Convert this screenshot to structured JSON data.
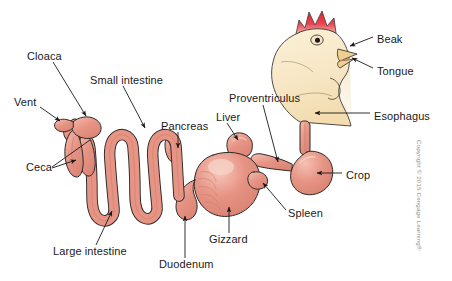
{
  "figure": {
    "background": "#ffffff",
    "copyright": "Copyright © 2015 Cengage Learning®"
  },
  "palette": {
    "organ_fill": "#e79485",
    "organ_fill_light": "#f2b4a6",
    "organ_highlight": "#f6c9bd",
    "organ_outline": "#2b2b2b",
    "head_fill": "#f7e6c4",
    "head_fill_light": "#fdf6e4",
    "comb_red": "#e3212b",
    "comb_red_light": "#f06a72",
    "beak_fill": "#f0cf8e",
    "label_color": "#1a1a1a",
    "leader_color": "#1a1a1a",
    "copyright_color": "#8c8c8c"
  },
  "labels": [
    {
      "id": "cloaca",
      "text": "Cloaca",
      "x": 27,
      "y": 57,
      "anchor": "start"
    },
    {
      "id": "vent",
      "text": "Vent",
      "x": 14,
      "y": 103,
      "anchor": "start"
    },
    {
      "id": "small-intestine",
      "text": "Small intestine",
      "x": 90,
      "y": 81,
      "anchor": "start"
    },
    {
      "id": "ceca",
      "text": "Ceca",
      "x": 26,
      "y": 168,
      "anchor": "start"
    },
    {
      "id": "large-intestine",
      "text": "Large intestine",
      "x": 53,
      "y": 252,
      "anchor": "start"
    },
    {
      "id": "pancreas",
      "text": "Pancreas",
      "x": 161,
      "y": 127,
      "anchor": "start"
    },
    {
      "id": "duodenum",
      "text": "Duodenum",
      "x": 159,
      "y": 265,
      "anchor": "start"
    },
    {
      "id": "liver",
      "text": "Liver",
      "x": 216,
      "y": 118,
      "anchor": "start"
    },
    {
      "id": "gizzard",
      "text": "Gizzard",
      "x": 209,
      "y": 240,
      "anchor": "start"
    },
    {
      "id": "proventriculus",
      "text": "Proventriculus",
      "x": 229,
      "y": 99,
      "anchor": "start"
    },
    {
      "id": "spleen",
      "text": "Spleen",
      "x": 288,
      "y": 214,
      "anchor": "start"
    },
    {
      "id": "crop",
      "text": "Crop",
      "x": 346,
      "y": 176,
      "anchor": "start"
    },
    {
      "id": "esophagus",
      "text": "Esophagus",
      "x": 374,
      "y": 117,
      "anchor": "start"
    },
    {
      "id": "beak",
      "text": "Beak",
      "x": 377,
      "y": 40,
      "anchor": "start"
    },
    {
      "id": "tongue",
      "text": "Tongue",
      "x": 377,
      "y": 72,
      "anchor": "start"
    }
  ],
  "organs": [
    {
      "id": "beak",
      "name": "Beak"
    },
    {
      "id": "tongue",
      "name": "Tongue"
    },
    {
      "id": "esophagus",
      "name": "Esophagus"
    },
    {
      "id": "crop",
      "name": "Crop"
    },
    {
      "id": "proventriculus",
      "name": "Proventriculus"
    },
    {
      "id": "gizzard",
      "name": "Gizzard"
    },
    {
      "id": "liver",
      "name": "Liver"
    },
    {
      "id": "spleen",
      "name": "Spleen"
    },
    {
      "id": "pancreas",
      "name": "Pancreas"
    },
    {
      "id": "duodenum",
      "name": "Duodenum"
    },
    {
      "id": "small-intestine",
      "name": "Small intestine"
    },
    {
      "id": "large-intestine",
      "name": "Large intestine"
    },
    {
      "id": "ceca",
      "name": "Ceca"
    },
    {
      "id": "cloaca",
      "name": "Cloaca"
    },
    {
      "id": "vent",
      "name": "Vent"
    }
  ]
}
